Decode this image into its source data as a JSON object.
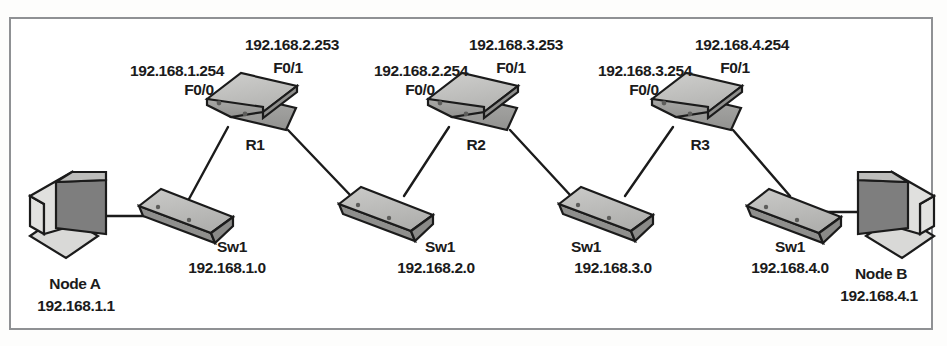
{
  "diagram": {
    "type": "network-topology",
    "title": "",
    "colors": {
      "frame_border": "#8f9194",
      "background": "#ffffff",
      "device_fill": "#b9b9b7",
      "device_fill_light": "#d3d3d1",
      "device_fill_dark": "#9a9a98",
      "screen_fill": "#7e7e7e",
      "line": "#1b1b1b",
      "text": "#1b1b1b"
    },
    "routers": [
      {
        "name": "R1",
        "left_ip": "192.168.1.254",
        "left_iface": "F0/0",
        "right_ip": "192.168.2.253",
        "right_iface": "F0/1"
      },
      {
        "name": "R2",
        "left_ip": "192.168.2.254",
        "left_iface": "F0/0",
        "right_ip": "192.168.3.253",
        "right_iface": "F0/1"
      },
      {
        "name": "R3",
        "left_ip": "192.168.3.254",
        "left_iface": "F0/0",
        "right_ip": "192.168.4.254",
        "right_iface": "F0/1"
      }
    ],
    "switches": [
      {
        "name": "Sw1",
        "subnet": "192.168.1.0"
      },
      {
        "name": "Sw1",
        "subnet": "192.168.2.0"
      },
      {
        "name": "Sw1",
        "subnet": "192.168.3.0"
      },
      {
        "name": "Sw1",
        "subnet": "192.168.4.0"
      }
    ],
    "nodes": [
      {
        "name": "Node A",
        "ip": "192.168.1.1"
      },
      {
        "name": "Node B",
        "ip": "192.168.4.1"
      }
    ]
  }
}
